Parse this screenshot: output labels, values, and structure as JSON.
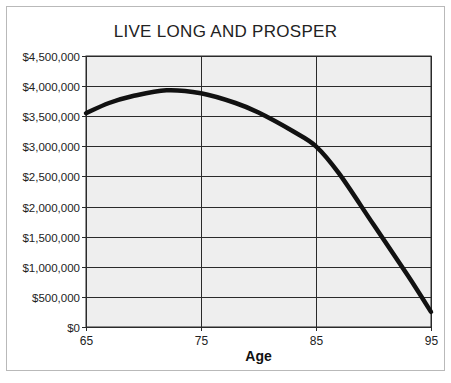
{
  "chart_data": {
    "type": "line",
    "title": "LIVE LONG AND PROSPER",
    "xlabel": "Age",
    "ylabel": "",
    "x_ticks": [
      "65",
      "75",
      "85",
      "95"
    ],
    "y_ticks": [
      "$0",
      "$500,000",
      "$1,000,000",
      "$1,500,000",
      "$2,000,000",
      "$2,500,000",
      "$3,000,000",
      "$3,500,000",
      "$4,000,000",
      "$4,500,000"
    ],
    "xlim": [
      65,
      95
    ],
    "ylim": [
      0,
      4500000
    ],
    "grid": true,
    "legend": null,
    "series": [
      {
        "name": "Portfolio value",
        "x": [
          65,
          67,
          69,
          72,
          75,
          78,
          80,
          83,
          85,
          87,
          90,
          93,
          95
        ],
        "values": [
          3550000,
          3720000,
          3830000,
          3930000,
          3880000,
          3720000,
          3560000,
          3250000,
          3000000,
          2550000,
          1700000,
          850000,
          250000
        ]
      }
    ]
  },
  "colors": {
    "plot_bg": "#eeeeee",
    "grid": "#2a2a2a",
    "line": "#111111",
    "frame": "#b9b9b9"
  }
}
